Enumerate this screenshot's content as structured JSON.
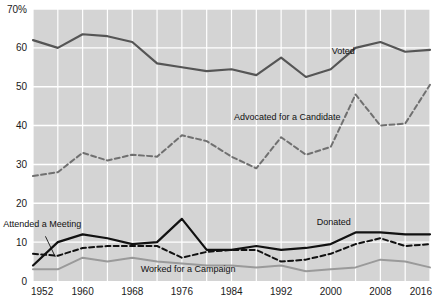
{
  "chart_data": {
    "type": "line",
    "title": "",
    "subtitle": "",
    "xlabel": "",
    "ylabel": "",
    "x": [
      1952,
      1956,
      1960,
      1964,
      1968,
      1972,
      1976,
      1980,
      1984,
      1988,
      1992,
      1996,
      2000,
      2004,
      2008,
      2012,
      2016
    ],
    "xlim": [
      1952,
      2016
    ],
    "ylim": [
      0,
      70
    ],
    "xticks": [
      1952,
      1960,
      1968,
      1976,
      1984,
      1992,
      2000,
      2008,
      2016
    ],
    "xtick_labels": [
      "1952",
      "1960",
      "1968",
      "1976",
      "1984",
      "1992",
      "2000",
      "2008",
      "2016"
    ],
    "yticks": [
      0,
      10,
      20,
      30,
      40,
      50,
      60,
      70
    ],
    "ytick_labels": [
      "0",
      "10",
      "20",
      "30",
      "40",
      "50",
      "60",
      "70%"
    ],
    "grid": true,
    "grid_color": "#ffffff",
    "plot_background": "#d4d4d4",
    "legend_position": "inline-annotations",
    "series": [
      {
        "name": "Voted",
        "label": "Voted",
        "color": "#555555",
        "style": "solid",
        "width": 2.2,
        "label_x": 2002,
        "label_y": 58.5,
        "values": [
          62.0,
          60.0,
          63.5,
          63.0,
          61.5,
          56.0,
          55.0,
          54.0,
          54.5,
          53.0,
          57.5,
          52.5,
          54.5,
          60.0,
          61.5,
          59.0,
          59.5
        ]
      },
      {
        "name": "Advocated for a Candidate",
        "label": "Advocated for a Candidate",
        "color": "#707070",
        "style": "dashed",
        "width": 2.0,
        "label_x": 1993,
        "label_y": 41.5,
        "values": [
          27.0,
          28.0,
          33.0,
          31.0,
          32.5,
          32.0,
          37.5,
          36.0,
          32.0,
          29.0,
          37.0,
          32.5,
          34.5,
          48.0,
          40.0,
          40.5,
          50.5
        ]
      },
      {
        "name": "Attended a Meeting",
        "label": "Attended a Meeting",
        "color": "#111111",
        "style": "solid",
        "width": 2.2,
        "label_x": 1953.5,
        "label_y": 14.0,
        "values": [
          4.0,
          10.0,
          12.0,
          11.0,
          9.5,
          10.0,
          16.0,
          8.0,
          8.0,
          9.0,
          8.0,
          8.5,
          9.5,
          12.5,
          12.5,
          12.0,
          12.0
        ]
      },
      {
        "name": "Donated",
        "label": "Donated",
        "color": "#111111",
        "style": "dashed",
        "width": 2.0,
        "label_x": 2000.5,
        "label_y": 14.5,
        "values": [
          7.0,
          6.5,
          8.5,
          9.0,
          9.0,
          9.0,
          6.0,
          7.5,
          8.0,
          8.0,
          5.0,
          5.5,
          7.0,
          9.5,
          11.0,
          9.0,
          9.5
        ]
      },
      {
        "name": "Worked for a Campaign",
        "label": "Worked for a Campaign",
        "color": "#9a9a9a",
        "style": "solid",
        "width": 2.0,
        "label_x": 1977,
        "label_y": 2.2,
        "values": [
          3.0,
          3.0,
          6.0,
          5.0,
          6.0,
          5.0,
          4.5,
          4.0,
          4.0,
          3.5,
          4.0,
          2.5,
          3.0,
          3.5,
          5.5,
          5.0,
          3.5
        ]
      }
    ],
    "annotations": [
      {
        "name": "attended-a-meeting-leader-line",
        "from": [
          1954.0,
          11.5
        ],
        "to": [
          1955.6,
          6.2
        ]
      }
    ]
  },
  "plot_area": {
    "left": 33,
    "top": 9,
    "right": 430,
    "bottom": 281
  }
}
